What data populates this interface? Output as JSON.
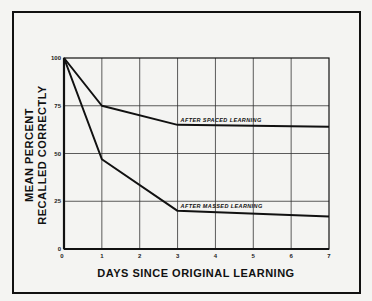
{
  "chart_data": {
    "type": "line",
    "title": "",
    "xlabel": "DAYS SINCE ORIGINAL LEARNING",
    "ylabel_line1": "MEAN PERCENT",
    "ylabel_line2": "RECALLED CORRECTLY",
    "x": [
      0,
      1,
      3,
      7
    ],
    "xlim": [
      0,
      7
    ],
    "ylim": [
      0,
      100
    ],
    "x_ticks": [
      "0",
      "1",
      "2",
      "3",
      "4",
      "5",
      "6",
      "7"
    ],
    "y_ticks": [
      "0",
      "25",
      "50",
      "75",
      "100"
    ],
    "grid": true,
    "legend": "inline annotations",
    "series": [
      {
        "name": "AFTER SPACED LEARNING",
        "values": [
          100,
          75,
          65,
          64
        ]
      },
      {
        "name": "AFTER MASSED LEARNING",
        "values": [
          100,
          47,
          20,
          17
        ]
      }
    ],
    "annotations": [
      "AFTER SPACED LEARNING",
      "AFTER MASSED LEARNING"
    ]
  }
}
